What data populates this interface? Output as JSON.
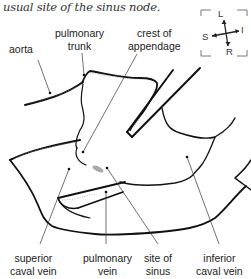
{
  "caption": "usual site of the sinus node.",
  "compass": {
    "up": "L",
    "down": "R",
    "left": "S",
    "right": "I"
  },
  "labels": {
    "aorta": "aorta",
    "pulmonary_trunk_1": "pulmonary",
    "pulmonary_trunk_2": "trunk",
    "crest_1": "crest of",
    "crest_2": "appendage",
    "superior_1": "superior",
    "superior_2": "caval vein",
    "pulmonary_vein_1": "pulmonary",
    "pulmonary_vein_2": "vein",
    "sinus_1": "site of",
    "sinus_2": "sinus",
    "inferior_1": "inferior",
    "inferior_2": "caval vein"
  },
  "colors": {
    "line": "#111111",
    "leader": "#333333",
    "stipple": "#888888",
    "sinus_mark": "#aaaaaa"
  }
}
